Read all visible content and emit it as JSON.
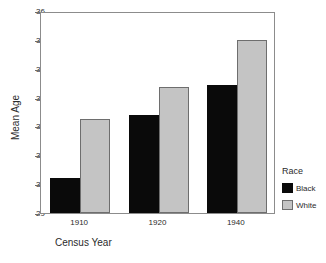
{
  "chart_data": {
    "type": "bar",
    "title": "",
    "xlabel": "Census Year",
    "ylabel": "Mean Age",
    "categories": [
      "1910",
      "1920",
      "1940"
    ],
    "series": [
      {
        "name": "Black",
        "color": "#000000",
        "values": [
          30.2,
          32.4,
          33.45
        ]
      },
      {
        "name": "White",
        "color": "#c4c4c4",
        "values": [
          32.25,
          33.37,
          35.0
        ]
      }
    ],
    "ylim": [
      29,
      36
    ],
    "ytick_labels": [
      "29",
      "30",
      "31",
      "32",
      "33",
      "34",
      "35",
      "36"
    ],
    "ytick_values": [
      29,
      30,
      31,
      32,
      33,
      34,
      35,
      36
    ],
    "xtick_labels": [
      "1910",
      "1920",
      "1940"
    ],
    "grid": false,
    "legend": {
      "title": "Race",
      "position": "right",
      "entries": [
        {
          "label": "Black",
          "color": "#000000"
        },
        {
          "label": "White",
          "color": "#c4c4c4"
        }
      ]
    },
    "frame_color": "#8c8c8c",
    "background": "#ffffff"
  }
}
